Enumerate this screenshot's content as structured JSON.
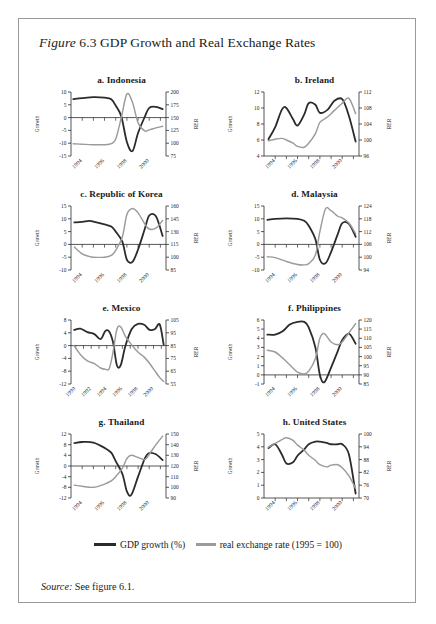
{
  "figure": {
    "label_prefix": "Figure",
    "number": "6.3",
    "title": "GDP Growth and Real Exchange Rates"
  },
  "legend": {
    "series_dark_label": "GDP growth (%)",
    "series_gray_label": "real exchange rate (1995 = 100)",
    "color_dark": "#2b2b2b",
    "color_gray": "#9b9b9b"
  },
  "source": {
    "label": "Source:",
    "text": "See figure 6.1."
  },
  "axis_titles": {
    "left": "Growth",
    "right": "RER"
  },
  "chart_data": [
    {
      "type": "line",
      "title": "a. Indonesia",
      "xlabel": "",
      "ylabel": "Growth",
      "y2label": "RER",
      "grid": false,
      "legend_position": "below-figure",
      "xlim": [
        1993.0,
        2001.5
      ],
      "xticks": [
        1994,
        1996,
        1998,
        2000
      ],
      "ylim": [
        -15,
        10
      ],
      "yticks": [
        10,
        5,
        0,
        -5,
        -10,
        -15
      ],
      "y2lim": [
        75,
        200
      ],
      "y2ticks": [
        200,
        175,
        150,
        125,
        100,
        75
      ],
      "x": [
        1993.2,
        1994,
        1995,
        1996,
        1996.6,
        1997,
        1997.5,
        1998,
        1998.5,
        1999,
        1999.6,
        2000,
        2000.6,
        2001.2
      ],
      "series": [
        {
          "name": "GDP growth (%)",
          "color": "#2b2b2b",
          "axis": "left",
          "values": [
            7.2,
            7.6,
            8.0,
            7.8,
            7.2,
            4.7,
            0.5,
            -9.5,
            -13.1,
            -6.0,
            0.3,
            3.8,
            4.2,
            3.3
          ]
        },
        {
          "name": "real exchange rate (1995 = 100)",
          "color": "#9b9b9b",
          "axis": "right",
          "values": [
            99,
            98,
            97,
            97,
            99,
            108,
            150,
            196,
            180,
            140,
            124,
            126,
            130,
            133
          ]
        }
      ]
    },
    {
      "type": "line",
      "title": "b. Ireland",
      "xlabel": "",
      "ylabel": "Growth",
      "y2label": "RER",
      "grid": false,
      "legend_position": "below-figure",
      "xlim": [
        1993.0,
        2001.5
      ],
      "xticks": [
        1994,
        1996,
        1998,
        2000
      ],
      "ylim": [
        4,
        12
      ],
      "yticks": [
        12,
        10,
        8,
        6,
        4
      ],
      "y2lim": [
        96,
        112
      ],
      "y2ticks": [
        112,
        108,
        104,
        100,
        96
      ],
      "x": [
        1993.4,
        1994,
        1994.6,
        1995,
        1995.6,
        1996,
        1996.6,
        1997,
        1997.6,
        1998,
        1998.7,
        1999.3,
        2000,
        2000.6,
        2001.2
      ],
      "series": [
        {
          "name": "GDP growth (%)",
          "color": "#2b2b2b",
          "axis": "left",
          "values": [
            6.1,
            7.6,
            9.8,
            10.0,
            8.6,
            7.8,
            9.2,
            10.6,
            10.4,
            9.4,
            9.8,
            10.9,
            11.1,
            9.0,
            5.8
          ]
        },
        {
          "name": "real exchange rate (1995 = 100)",
          "color": "#9b9b9b",
          "axis": "right",
          "values": [
            99.8,
            100.2,
            100.4,
            100.0,
            99.2,
            98.4,
            98.2,
            99.2,
            101.6,
            104.4,
            105.8,
            107.4,
            109.2,
            110.4,
            106.6
          ]
        }
      ]
    },
    {
      "type": "line",
      "title": "c. Republic of Korea",
      "xlabel": "",
      "ylabel": "Growth",
      "y2label": "RER",
      "grid": false,
      "legend_position": "below-figure",
      "xlim": [
        1993.0,
        2001.5
      ],
      "xticks": [
        1994,
        1996,
        1998,
        2000
      ],
      "ylim": [
        -10,
        15
      ],
      "yticks": [
        15,
        10,
        5,
        0,
        -5,
        -10
      ],
      "y2lim": [
        85,
        160
      ],
      "y2ticks": [
        160,
        145,
        130,
        115,
        100,
        85
      ],
      "x": [
        1993.3,
        1994,
        1994.6,
        1995,
        1996,
        1996.6,
        1997,
        1997.6,
        1998,
        1998.5,
        1999,
        1999.6,
        2000,
        2000.6,
        2001.2
      ],
      "series": [
        {
          "name": "GDP growth (%)",
          "color": "#2b2b2b",
          "axis": "left",
          "values": [
            8.6,
            8.8,
            9.2,
            8.9,
            7.8,
            7.0,
            5.0,
            1.0,
            -6.0,
            -6.8,
            -2.0,
            6.0,
            11.3,
            11.0,
            3.3
          ]
        },
        {
          "name": "real exchange rate (1995 = 100)",
          "color": "#9b9b9b",
          "axis": "right",
          "values": [
            112,
            104,
            101,
            100,
            100,
            102,
            108,
            124,
            150,
            157,
            152,
            139,
            133,
            134,
            143
          ]
        }
      ]
    },
    {
      "type": "line",
      "title": "d. Malaysia",
      "xlabel": "",
      "ylabel": "Growth",
      "y2label": "RER",
      "grid": false,
      "legend_position": "below-figure",
      "xlim": [
        1993.0,
        2001.5
      ],
      "xticks": [
        1994,
        1996,
        1998,
        2000
      ],
      "ylim": [
        -10,
        15
      ],
      "yticks": [
        15,
        10,
        5,
        0,
        -5,
        -10
      ],
      "y2lim": [
        94,
        124
      ],
      "y2ticks": [
        124,
        118,
        112,
        106,
        100,
        94
      ],
      "x": [
        1993.3,
        1994,
        1995,
        1996,
        1996.6,
        1997,
        1997.6,
        1998,
        1998.5,
        1999,
        1999.6,
        2000,
        2000.6,
        2001.2
      ],
      "series": [
        {
          "name": "GDP growth (%)",
          "color": "#2b2b2b",
          "axis": "left",
          "values": [
            9.6,
            10.0,
            10.2,
            10.0,
            9.2,
            7.3,
            2.0,
            -6.0,
            -7.4,
            -3.0,
            4.0,
            8.3,
            8.0,
            3.0
          ]
        },
        {
          "name": "real exchange rate (1995 = 100)",
          "color": "#9b9b9b",
          "axis": "right",
          "values": [
            100.2,
            99.8,
            98.0,
            96.6,
            96.4,
            97.0,
            101.0,
            112.0,
            122.6,
            121.8,
            119.2,
            118.4,
            116.0,
            111.0
          ]
        }
      ]
    },
    {
      "type": "line",
      "title": "e. Mexico",
      "xlabel": "",
      "ylabel": "Growth",
      "y2label": "RER",
      "grid": false,
      "legend_position": "below-figure",
      "xlim": [
        1989.4,
        2001.6
      ],
      "xticks": [
        1990,
        1992,
        1994,
        1996,
        1998,
        2000
      ],
      "ylim": [
        -12,
        8
      ],
      "yticks": [
        8,
        4,
        0,
        -4,
        -8,
        -12
      ],
      "y2lim": [
        55,
        105
      ],
      "y2ticks": [
        105,
        95,
        85,
        75,
        65,
        55
      ],
      "x": [
        1989.8,
        1990.6,
        1991.5,
        1992.4,
        1993.2,
        1993.8,
        1994.3,
        1994.8,
        1995.3,
        1995.8,
        1996.4,
        1997.2,
        1998,
        1998.8,
        1999.5,
        2000.2,
        2000.8,
        2001.3
      ],
      "series": [
        {
          "name": "GDP growth (%)",
          "color": "#2b2b2b",
          "axis": "left",
          "values": [
            4.9,
            5.3,
            4.2,
            3.6,
            2.0,
            4.5,
            4.4,
            1.0,
            -6.2,
            -6.0,
            0.0,
            5.2,
            6.8,
            6.5,
            4.9,
            5.2,
            6.6,
            0.3
          ]
        },
        {
          "name": "real exchange rate (1995 = 100)",
          "color": "#9b9b9b",
          "axis": "right",
          "values": [
            85.0,
            78.0,
            73.0,
            71.0,
            67.5,
            66.5,
            67.0,
            80.0,
            98.0,
            99.5,
            92.0,
            85.5,
            80.0,
            76.0,
            71.0,
            65.0,
            60.0,
            57.0
          ]
        }
      ]
    },
    {
      "type": "line",
      "title": "f. Philippines",
      "xlabel": "",
      "ylabel": "Growth",
      "y2label": "RER",
      "grid": false,
      "legend_position": "below-figure",
      "xlim": [
        1993.0,
        2001.5
      ],
      "xticks": [
        1994,
        1996,
        1998,
        2000
      ],
      "ylim": [
        -1,
        6
      ],
      "yticks": [
        6,
        5,
        4,
        3,
        2,
        1,
        0,
        -1
      ],
      "y2lim": [
        85,
        120
      ],
      "y2ticks": [
        120,
        115,
        110,
        105,
        100,
        95,
        90,
        85
      ],
      "x": [
        1993.3,
        1994,
        1994.7,
        1995.3,
        1996,
        1996.6,
        1997,
        1997.6,
        1998,
        1998.4,
        1999,
        1999.6,
        2000,
        2000.6,
        2001.2
      ],
      "series": [
        {
          "name": "GDP growth (%)",
          "color": "#2b2b2b",
          "axis": "left",
          "values": [
            4.4,
            4.4,
            4.8,
            5.5,
            5.8,
            5.8,
            5.2,
            3.0,
            0.0,
            -0.8,
            0.8,
            2.6,
            3.8,
            4.5,
            3.4
          ]
        },
        {
          "name": "real exchange rate (1995 = 100)",
          "color": "#9b9b9b",
          "axis": "right",
          "values": [
            103.5,
            102.5,
            99.0,
            95.5,
            91.5,
            90.5,
            92.0,
            99.0,
            110.0,
            112.5,
            108.0,
            106.5,
            108.0,
            113.0,
            118.0
          ]
        }
      ]
    },
    {
      "type": "line",
      "title": "g. Thailand",
      "xlabel": "",
      "ylabel": "Growth",
      "y2label": "RER",
      "grid": false,
      "legend_position": "below-figure",
      "xlim": [
        1993.0,
        2001.5
      ],
      "xticks": [
        1994,
        1996,
        1998,
        2000
      ],
      "ylim": [
        -12,
        12
      ],
      "yticks": [
        12,
        8,
        4,
        0,
        -4,
        -8,
        -12
      ],
      "y2lim": [
        90,
        150
      ],
      "y2ticks": [
        150,
        140,
        130,
        120,
        110,
        100,
        90
      ],
      "x": [
        1993.3,
        1994,
        1995,
        1996,
        1996.6,
        1997,
        1997.6,
        1998,
        1998.4,
        1999,
        1999.6,
        2000,
        2000.6,
        2001.2
      ],
      "series": [
        {
          "name": "GDP growth (%)",
          "color": "#2b2b2b",
          "axis": "left",
          "values": [
            8.6,
            9.0,
            8.8,
            6.8,
            5.0,
            1.8,
            -3.0,
            -9.5,
            -10.8,
            -4.0,
            2.8,
            4.8,
            4.4,
            2.2
          ]
        },
        {
          "name": "real exchange rate (1995 = 100)",
          "color": "#9b9b9b",
          "axis": "right",
          "values": [
            102,
            101,
            100,
            103,
            106,
            110,
            118,
            127,
            130,
            128,
            126,
            131,
            140,
            148
          ]
        }
      ]
    },
    {
      "type": "line",
      "title": "h. United States",
      "xlabel": "",
      "ylabel": "Growth",
      "y2label": "RER",
      "grid": false,
      "legend_position": "below-figure",
      "xlim": [
        1993.0,
        2001.5
      ],
      "xticks": [
        1994,
        1996,
        1998,
        2000
      ],
      "ylim": [
        0,
        5
      ],
      "yticks": [
        5,
        4,
        3,
        2,
        1,
        0
      ],
      "y2lim": [
        70,
        100
      ],
      "y2ticks": [
        100,
        94,
        88,
        82,
        76,
        70
      ],
      "x": [
        1993.4,
        1994,
        1994.6,
        1995,
        1995.6,
        1996,
        1996.6,
        1997,
        1997.6,
        1998,
        1998.6,
        1999,
        1999.6,
        2000,
        2000.6,
        2001.2
      ],
      "series": [
        {
          "name": "GDP growth (%)",
          "color": "#2b2b2b",
          "axis": "left",
          "values": [
            3.9,
            4.2,
            3.4,
            2.7,
            2.8,
            3.3,
            3.8,
            4.2,
            4.4,
            4.4,
            4.3,
            4.2,
            4.2,
            4.2,
            3.4,
            0.35
          ]
        },
        {
          "name": "real exchange rate (1995 = 100)",
          "color": "#9b9b9b",
          "axis": "right",
          "values": [
            93.8,
            95.6,
            97.4,
            98.2,
            97.0,
            94.8,
            92.4,
            90.0,
            87.6,
            85.6,
            84.6,
            85.4,
            85.6,
            84.2,
            80.4,
            74.5
          ]
        }
      ]
    }
  ]
}
